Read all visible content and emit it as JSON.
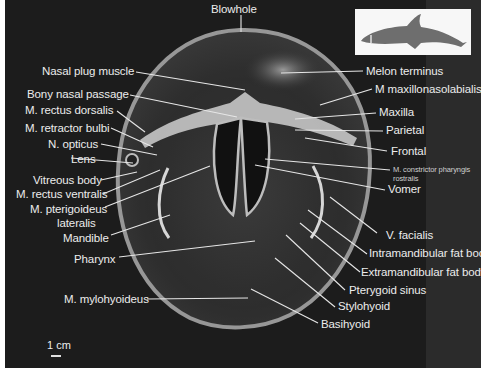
{
  "figure": {
    "background_color": "#1c1c1c",
    "label_color": "#ececec",
    "inset": {
      "description": "dolphin silhouette with section line",
      "silhouette_color": "#6e6e6e",
      "section_line_color": "#ffffff"
    },
    "scale_bar": {
      "label": "1 cm"
    }
  },
  "labels": {
    "top": [
      {
        "id": "blowhole",
        "text": "Blowhole"
      }
    ],
    "left": [
      {
        "id": "nasal-plug-muscle",
        "text": "Nasal plug muscle"
      },
      {
        "id": "bony-nasal-passage",
        "text": "Bony nasal passage"
      },
      {
        "id": "m-rectus-dorsalis",
        "text": "M. rectus dorsalis"
      },
      {
        "id": "m-retractor-bulbi",
        "text": "M. retractor bulbi"
      },
      {
        "id": "n-opticus",
        "text": "N. opticus"
      },
      {
        "id": "lens",
        "text": "Lens"
      },
      {
        "id": "vitreous-body",
        "text": "Vitreous body"
      },
      {
        "id": "m-rectus-ventralis",
        "text": "M. rectus ventralis"
      },
      {
        "id": "m-pterigoideus",
        "text": "M. pterigoideus"
      },
      {
        "id": "lateralis",
        "text": "lateralis"
      },
      {
        "id": "mandible",
        "text": "Mandible"
      },
      {
        "id": "pharynx",
        "text": "Pharynx"
      },
      {
        "id": "m-mylohyoideus",
        "text": "M. mylohyoideus"
      }
    ],
    "right": [
      {
        "id": "melon-terminus",
        "text": "Melon terminus"
      },
      {
        "id": "m-maxillonasolabialis",
        "text": "M maxillonasolabialis"
      },
      {
        "id": "maxilla",
        "text": "Maxilla"
      },
      {
        "id": "parietal",
        "text": "Parietal"
      },
      {
        "id": "frontal",
        "text": "Frontal"
      },
      {
        "id": "m-constrictor-1",
        "text": "M. constrictor pharyngis"
      },
      {
        "id": "m-constrictor-2",
        "text": "rostralis"
      },
      {
        "id": "vomer",
        "text": "Vomer"
      },
      {
        "id": "v-facialis",
        "text": "V. facialis"
      },
      {
        "id": "intramandibular-fat-body",
        "text": "Intramandibular fat body"
      },
      {
        "id": "extramandibular-fat-body",
        "text": "Extramandibular fat body"
      },
      {
        "id": "pterygoid-sinus",
        "text": "Pterygoid sinus"
      },
      {
        "id": "stylohyoid",
        "text": "Stylohyoid"
      },
      {
        "id": "basihyoid",
        "text": "Basihyoid"
      }
    ]
  }
}
